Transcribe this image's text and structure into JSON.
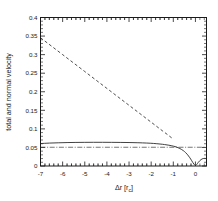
{
  "chart_data": {
    "type": "line",
    "title": "",
    "xlabel": "Δr [r",
    "xlabel_sub": "c",
    "xlabel_suffix": "]",
    "ylabel": "total and normal velocity",
    "xlim": [
      -7.0,
      0.5
    ],
    "ylim": [
      0.0,
      0.4
    ],
    "grid": false,
    "legend": "none",
    "xticks": [
      -7,
      -6,
      -5,
      -4,
      -3,
      -2,
      -1,
      0
    ],
    "xtick_labels": [
      "-7",
      "-6",
      "-5",
      "-4",
      "-3",
      "-2",
      "-1",
      "0"
    ],
    "xminor_per_interval": 5,
    "yticks": [
      0,
      0.05,
      0.1,
      0.15,
      0.2,
      0.25,
      0.3,
      0.35,
      0.4
    ],
    "ytick_labels": [
      "0",
      "0.05",
      "0.1",
      "0.15",
      "0.2",
      "0.25",
      "0.3",
      "0.35",
      "0.4"
    ],
    "yminor_per_interval": 5,
    "series": [
      {
        "name": "total velocity",
        "style": "solid",
        "color": "#2b2b2b",
        "x": [
          -7.0,
          -6.6,
          -6.2,
          -5.8,
          -5.4,
          -5.0,
          -4.6,
          -4.2,
          -3.8,
          -3.4,
          -3.0,
          -2.6,
          -2.2,
          -1.9,
          -1.6,
          -1.4,
          -1.2,
          -1.0,
          -0.85,
          -0.7,
          -0.55,
          -0.45,
          -0.35,
          -0.25,
          -0.18,
          -0.12,
          -0.06,
          0.0,
          0.06,
          0.12,
          0.2,
          0.3,
          0.4,
          0.5
        ],
        "y": [
          0.0605,
          0.0617,
          0.0625,
          0.0631,
          0.0635,
          0.0637,
          0.0638,
          0.0638,
          0.0637,
          0.0635,
          0.0632,
          0.0627,
          0.0618,
          0.0608,
          0.0592,
          0.0578,
          0.056,
          0.0535,
          0.051,
          0.047,
          0.0415,
          0.0365,
          0.03,
          0.022,
          0.0155,
          0.0095,
          0.0045,
          0.0015,
          0.0042,
          0.009,
          0.0145,
          0.019,
          0.0205,
          0.02
        ]
      },
      {
        "name": "normal velocity",
        "style": "dashed",
        "color": "#3a3a3a",
        "x": [
          -7.0,
          -6.0,
          -5.0,
          -4.0,
          -3.0,
          -2.0,
          -1.5,
          -1.25,
          -1.1,
          -1.0
        ],
        "y": [
          0.3455,
          0.3,
          0.2545,
          0.209,
          0.1635,
          0.118,
          0.0952,
          0.084,
          0.077,
          0.0725
        ]
      },
      {
        "name": "reference level",
        "style": "dashdot",
        "color": "#3a3a3a",
        "x": [
          -7.0,
          0.5
        ],
        "y": [
          0.0505,
          0.0505
        ]
      }
    ]
  }
}
